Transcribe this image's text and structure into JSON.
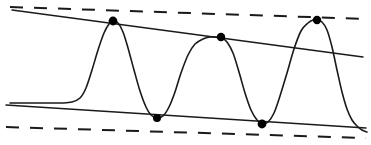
{
  "figure": {
    "title": "",
    "width": 371,
    "height": 145,
    "background_color": "#ffffff",
    "stroke_color": "#1a1a1a",
    "marker_color": "#000000"
  },
  "chart_data": {
    "type": "line",
    "title": "",
    "subtitle": "",
    "xlabel": "",
    "ylabel": "",
    "xlim": [
      0,
      371
    ],
    "ylim": [
      145,
      0
    ],
    "grid": false,
    "legend_position": "none",
    "axes_visible": false,
    "tick_labels": {
      "x": [],
      "y": []
    },
    "series": [
      {
        "name": "oscillating-signal",
        "style": "solid",
        "stroke_width": 1.6,
        "description": "Flat at left, then three sharp oscillations between the upper and lower envelope lines, decaying to the lower envelope at the right edge.",
        "points": [
          [
            10,
            103
          ],
          [
            30,
            103
          ],
          [
            48,
            103
          ],
          [
            62,
            103
          ],
          [
            72,
            102
          ],
          [
            80,
            98
          ],
          [
            86,
            88
          ],
          [
            92,
            70
          ],
          [
            98,
            50
          ],
          [
            104,
            33
          ],
          [
            109,
            24
          ],
          [
            113,
            21
          ],
          [
            118,
            23
          ],
          [
            123,
            32
          ],
          [
            128,
            48
          ],
          [
            134,
            70
          ],
          [
            140,
            91
          ],
          [
            146,
            107
          ],
          [
            151,
            115
          ],
          [
            157,
            118
          ],
          [
            163,
            116
          ],
          [
            169,
            107
          ],
          [
            175,
            92
          ],
          [
            181,
            73
          ],
          [
            188,
            55
          ],
          [
            195,
            44
          ],
          [
            203,
            39
          ],
          [
            210,
            37
          ],
          [
            216,
            37
          ],
          [
            221,
            37
          ],
          [
            227,
            42
          ],
          [
            233,
            53
          ],
          [
            239,
            72
          ],
          [
            245,
            93
          ],
          [
            251,
            110
          ],
          [
            257,
            120
          ],
          [
            262,
            124
          ],
          [
            268,
            122
          ],
          [
            274,
            113
          ],
          [
            280,
            96
          ],
          [
            287,
            73
          ],
          [
            294,
            49
          ],
          [
            301,
            31
          ],
          [
            308,
            23
          ],
          [
            313,
            20
          ],
          [
            317,
            20
          ],
          [
            322,
            22
          ],
          [
            327,
            30
          ],
          [
            332,
            47
          ],
          [
            337,
            70
          ],
          [
            342,
            92
          ],
          [
            347,
            109
          ],
          [
            352,
            120
          ],
          [
            357,
            126
          ],
          [
            362,
            130
          ],
          [
            367,
            132
          ]
        ]
      },
      {
        "name": "upper-envelope",
        "style": "solid",
        "stroke_width": 1.4,
        "points": [
          [
            12,
            10
          ],
          [
            363,
            57
          ]
        ]
      },
      {
        "name": "lower-envelope",
        "style": "solid",
        "stroke_width": 1.4,
        "points": [
          [
            6,
            105
          ],
          [
            366,
            128
          ]
        ]
      },
      {
        "name": "upper-bound",
        "style": "dashed",
        "stroke_width": 2.0,
        "dash_pattern": "13 11",
        "points": [
          [
            10,
            7
          ],
          [
            367,
            19
          ]
        ]
      },
      {
        "name": "lower-bound",
        "style": "dashed",
        "stroke_width": 2.0,
        "dash_pattern": "13 11",
        "points": [
          [
            6,
            127
          ],
          [
            366,
            138
          ]
        ]
      }
    ],
    "markers": [
      {
        "name": "peak-1",
        "kind": "maximum",
        "x": 113,
        "y": 21,
        "radius": 4.4
      },
      {
        "name": "trough-1",
        "kind": "minimum",
        "x": 157,
        "y": 118,
        "radius": 4.0
      },
      {
        "name": "peak-2",
        "kind": "maximum",
        "x": 221,
        "y": 37,
        "radius": 4.2
      },
      {
        "name": "trough-2",
        "kind": "minimum",
        "x": 262,
        "y": 124,
        "radius": 4.4
      },
      {
        "name": "peak-3",
        "kind": "maximum",
        "x": 317,
        "y": 20,
        "radius": 4.2
      }
    ]
  }
}
